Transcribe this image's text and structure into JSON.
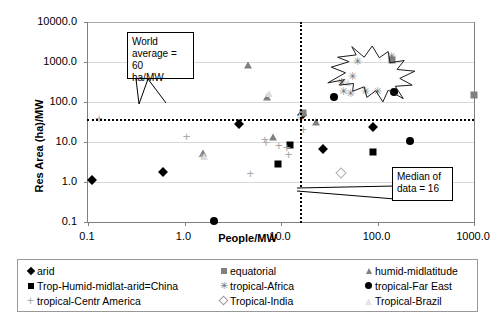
{
  "chart_data": {
    "type": "scatter",
    "title": "",
    "xlabel": "People/MW",
    "ylabel": "Res Area (ha)/MW",
    "x_scale": "log",
    "y_scale": "log",
    "xlim": [
      0.1,
      1000.0
    ],
    "ylim": [
      0.1,
      10000.0
    ],
    "xticks": [
      "0.1",
      "1.0",
      "10.0",
      "100.0",
      "1000.0"
    ],
    "yticks": [
      "0.1",
      "1.0",
      "10.0",
      "100.0",
      "1000.0",
      "10000.0"
    ],
    "grid": "horizontal",
    "legend_position": "below",
    "reference_lines": [
      {
        "name": "world-average",
        "orientation": "horizontal",
        "value": 38,
        "label": "World average = 60 ha/MW",
        "style": "dotted"
      },
      {
        "name": "median-of-data",
        "orientation": "vertical",
        "value": 16,
        "label": "Median of data = 16",
        "style": "dotted"
      }
    ],
    "annotations": [
      {
        "name": "world-average-callout",
        "text_lines": [
          "World",
          "average = 60",
          "ha/MW"
        ]
      },
      {
        "name": "median-callout",
        "text_lines": [
          "Median of",
          "data = 16"
        ]
      },
      {
        "name": "explosion-highlight",
        "shape": "star-burst",
        "x_range": [
          30,
          250
        ],
        "y_range": [
          100,
          2500
        ]
      }
    ],
    "series": [
      {
        "name": "arid",
        "marker": "filled-diamond",
        "color": "#000000",
        "points": [
          [
            0.11,
            1.1
          ],
          [
            0.6,
            1.75
          ],
          [
            3.7,
            28
          ],
          [
            16.5,
            47
          ],
          [
            90,
            24
          ],
          [
            27,
            6.8
          ]
        ]
      },
      {
        "name": "equatorial",
        "marker": "filled-square-gray",
        "color": "#808080",
        "points": [
          [
            16.8,
            52
          ],
          [
            140,
            1150
          ],
          [
            1000,
            150
          ]
        ]
      },
      {
        "name": "humid-midlatitude",
        "marker": "filled-triangle-gray",
        "color": "#808080",
        "points": [
          [
            1.55,
            5.2
          ],
          [
            23,
            32
          ],
          [
            4.6,
            820
          ],
          [
            7.2,
            130
          ],
          [
            8.2,
            13.5
          ]
        ]
      },
      {
        "name": "Trop-Humid-midlat-arid=China",
        "marker": "filled-square-black",
        "color": "#000000",
        "points": [
          [
            9.4,
            2.9
          ],
          [
            90,
            5.6
          ],
          [
            12.5,
            8.4
          ]
        ]
      },
      {
        "name": "tropical-Africa",
        "marker": "asterisk",
        "color": "#777777",
        "points": [
          [
            42,
            300
          ],
          [
            62,
            1000
          ],
          [
            140,
            1300
          ],
          [
            75,
            180
          ],
          [
            44,
            175
          ],
          [
            52,
            160
          ],
          [
            100,
            175
          ],
          [
            55,
            420
          ]
        ]
      },
      {
        "name": "tropical-Far East",
        "marker": "filled-circle-black",
        "color": "#000000",
        "points": [
          [
            2.0,
            0.105
          ],
          [
            35,
            130
          ],
          [
            150,
            180
          ],
          [
            215,
            10.5
          ]
        ]
      },
      {
        "name": "tropical-Centr America",
        "marker": "plus",
        "color": "#a8a8a8",
        "points": [
          [
            0.13,
            38
          ],
          [
            1.05,
            13.5
          ],
          [
            1.5,
            4.2
          ],
          [
            4.8,
            1.55
          ],
          [
            6.8,
            11
          ],
          [
            9.5,
            7.9
          ],
          [
            11.5,
            7.2
          ],
          [
            12,
            4.6
          ],
          [
            17,
            20
          ],
          [
            7.0,
            9.5
          ]
        ]
      },
      {
        "name": "Tropical-India",
        "marker": "open-diamond",
        "color": "#b0b0b0",
        "points": [
          [
            42,
            1.7
          ]
        ]
      },
      {
        "name": "Tropical-Brazil",
        "marker": "faint-triangle",
        "color": "#e0e0e0",
        "points": [
          [
            1.6,
            4.5
          ],
          [
            7.5,
            170
          ],
          [
            49,
            310
          ],
          [
            15.5,
            45
          ]
        ]
      }
    ]
  },
  "axis": {
    "y_title": "Res Area (ha)/MW",
    "x_title": "People/MW",
    "y_labels": [
      "10000.0",
      "1000.0",
      "100.0",
      "10.0",
      "1.0",
      "0.1"
    ],
    "x_labels": [
      "0.1",
      "1.0",
      "10.0",
      "100.0",
      "1000.0"
    ]
  },
  "callouts": {
    "world_average": "World average = 60 ha/MW",
    "world_average_l1": "World",
    "world_average_l2": "average = 60",
    "world_average_l3": "ha/MW",
    "median": "Median of data = 16",
    "median_l1": "Median of",
    "median_l2": "data = 16"
  },
  "legend": {
    "items": [
      {
        "label": "arid",
        "marker": "filled-diamond"
      },
      {
        "label": "equatorial",
        "marker": "filled-square-gray"
      },
      {
        "label": "humid-midlatitude",
        "marker": "filled-triangle-gray"
      },
      {
        "label": "Trop-Humid-midlat-arid=China",
        "marker": "filled-square-black"
      },
      {
        "label": "tropical-Africa",
        "marker": "asterisk"
      },
      {
        "label": "tropical-Far East",
        "marker": "filled-circle-black"
      },
      {
        "label": "tropical-Centr America",
        "marker": "plus"
      },
      {
        "label": "Tropical-India",
        "marker": "open-diamond"
      },
      {
        "label": "Tropical-Brazil",
        "marker": "faint-triangle"
      }
    ],
    "glyphs": {
      "asterisk": "✳",
      "plus": "+",
      "faint-triangle": "▲"
    }
  },
  "colors": {
    "axis": "#7f7f7f",
    "grid": "#d9d9d9",
    "marker_black": "#000000",
    "marker_gray": "#808080",
    "marker_light": "#a8a8a8",
    "marker_faint": "#e0e0e0"
  }
}
